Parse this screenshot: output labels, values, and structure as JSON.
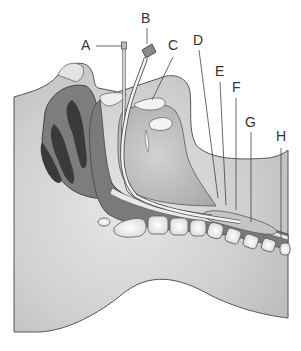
{
  "diagram": {
    "labels": [
      {
        "id": "A",
        "text": "A",
        "x": 81,
        "y": 38
      },
      {
        "id": "B",
        "text": "B",
        "x": 140,
        "y": 10
      },
      {
        "id": "C",
        "text": "C",
        "x": 168,
        "y": 37
      },
      {
        "id": "D",
        "text": "D",
        "x": 194,
        "y": 32
      },
      {
        "id": "E",
        "text": "E",
        "x": 215,
        "y": 63
      },
      {
        "id": "F",
        "text": "F",
        "x": 232,
        "y": 79
      },
      {
        "id": "G",
        "text": "G",
        "x": 245,
        "y": 114
      },
      {
        "id": "H",
        "text": "H",
        "x": 276,
        "y": 128
      }
    ]
  }
}
